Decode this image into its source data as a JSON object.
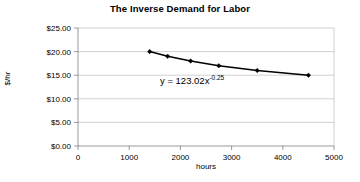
{
  "chart_data": {
    "type": "line",
    "title": "The Inverse Demand for Labor",
    "xlabel": "hours",
    "ylabel": "$/hr",
    "x": [
      1400,
      1750,
      2200,
      2750,
      3500,
      4500
    ],
    "values": [
      20.0,
      19.0,
      18.0,
      17.0,
      16.0,
      15.0
    ],
    "series": [
      {
        "name": "Inverse labor demand",
        "values": [
          20.0,
          19.0,
          18.0,
          17.0,
          16.0,
          15.0
        ]
      }
    ],
    "xlim": [
      0,
      5000
    ],
    "ylim": [
      0,
      25
    ],
    "xticks": [
      0,
      1000,
      2000,
      3000,
      4000,
      5000
    ],
    "xtick_labels": [
      "0",
      "1000",
      "2000",
      "3000",
      "4000",
      "5000"
    ],
    "yticks": [
      0,
      5,
      10,
      15,
      20,
      25
    ],
    "ytick_labels": [
      "$0.00",
      "$5.00",
      "$10.00",
      "$15.00",
      "$20.00",
      "$25.00"
    ],
    "grid": "horizontal",
    "legend": "none",
    "marker": "diamond",
    "line_color": "#000000",
    "marker_color": "#000000",
    "grid_color": "#b3b3b3",
    "axis_color": "#808080",
    "background": "#ffffff",
    "annotations": [
      {
        "name": "trendline-equation",
        "base_text": "y = 123.02x",
        "exponent_text": "-0.25",
        "full_text": "y = 123.02x^-0.25",
        "coefficient": 123.02,
        "exponent": -0.25
      }
    ]
  }
}
